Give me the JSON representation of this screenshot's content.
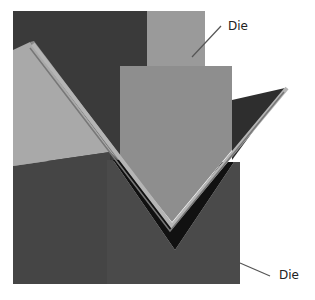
{
  "figure": {
    "labels": {
      "top": "Die",
      "bottom": "Die"
    },
    "colors": {
      "background": "#ffffff",
      "dark_backdrop": "#3a3a3a",
      "punch": "#8e8e8e",
      "punch_shank": "#9a9a9a",
      "left_plane": "#a9a9a9",
      "die_block": "#4a4a4a",
      "die_left_face": "#454545",
      "sheet_edge": "#b5b5b5",
      "v_gap": "#111111",
      "leader_line": "#555555"
    }
  }
}
